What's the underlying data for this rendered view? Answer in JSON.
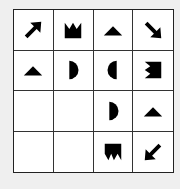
{
  "puzzle": {
    "rows": 4,
    "cols": 4,
    "colors": {
      "shape": "#000000",
      "cell_bg": "#ffffff",
      "grid_line": "#333333",
      "page_bg": "#efefef"
    },
    "cells": [
      [
        "arrow-up-right",
        "crown-up",
        "triangle-up",
        "arrow-down-right"
      ],
      [
        "triangle-up",
        "half-circle-right",
        "half-circle-left",
        "zigzag-left-block"
      ],
      [
        "empty",
        "empty",
        "half-circle-right",
        "triangle-up"
      ],
      [
        "empty",
        "empty",
        "zigzag-bottom-block",
        "arrow-down-left"
      ]
    ]
  }
}
